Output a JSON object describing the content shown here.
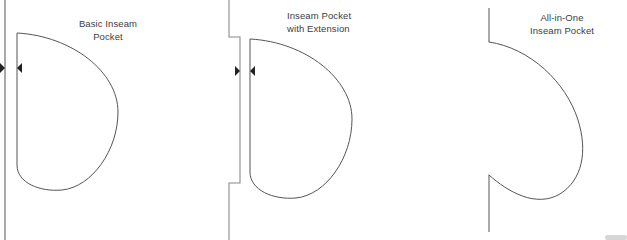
{
  "document": {
    "title": "Inseam Pocket Construction Variations",
    "background_color": "#ffffff",
    "line_color": "#555555",
    "text_color": "#3d3d3d"
  },
  "panels": [
    {
      "id": "basic",
      "caption": "Basic Inseam\nPocket",
      "seam_line": {
        "x": 5,
        "y_top": 0,
        "y_bottom": 240
      },
      "notch_markers": [
        {
          "direction": "left",
          "x": 5,
          "y": 68
        },
        {
          "direction": "right",
          "x": 17,
          "y": 68
        }
      ],
      "pocket_bag": {
        "edge_x": 17,
        "top_y": 33,
        "bottom_y": 165,
        "max_x": 118,
        "tip_y": 190
      }
    },
    {
      "id": "extension",
      "caption": "Inseam Pocket\nwith Extension",
      "seam_line": {
        "x": 229,
        "y_top": 0,
        "y_bottom": 240,
        "step_out_x": 240,
        "step_top_y": 37,
        "step_bottom_y": 183
      },
      "notch_markers": [
        {
          "direction": "left",
          "x": 240,
          "y": 71
        },
        {
          "direction": "right",
          "x": 250,
          "y": 71
        }
      ],
      "pocket_bag": {
        "edge_x": 250,
        "top_y": 39,
        "bottom_y": 172,
        "max_x": 352,
        "tip_y": 198
      }
    },
    {
      "id": "allinone",
      "caption": "All-in-One\nInseam Pocket",
      "seam_line": {
        "x": 489,
        "y_top": 0,
        "y_bottom": 240
      },
      "notch_markers": [],
      "pocket_bag": {
        "edge_x": 489,
        "top_y": 42,
        "bottom_y": 175,
        "max_x": 582,
        "tip_y": 200
      }
    }
  ]
}
